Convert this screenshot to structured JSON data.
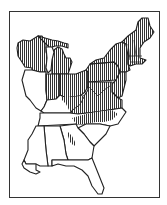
{
  "map": {
    "type": "range-map",
    "region": "Eastern United States",
    "legend": [],
    "hatched_regions": [
      "Wisconsin",
      "Michigan",
      "Ohio",
      "Indiana (north)",
      "Pennsylvania",
      "New York",
      "Vermont",
      "New Hampshire",
      "Maine",
      "Massachusetts",
      "Connecticut",
      "Rhode Island",
      "New Jersey",
      "Delaware",
      "Maryland",
      "West Virginia",
      "Virginia",
      "Kentucky (east)",
      "North Carolina (west/central)",
      "Tennessee (east tip)",
      "Georgia (small patch)"
    ],
    "unhatched_regions": [
      "Illinois",
      "Tennessee",
      "Mississippi",
      "Alabama",
      "South Carolina",
      "Georgia",
      "Florida",
      "Kentucky (west)"
    ],
    "colors": {
      "outline": "#222222",
      "hatch": "#333333",
      "background": "#ffffff"
    }
  }
}
